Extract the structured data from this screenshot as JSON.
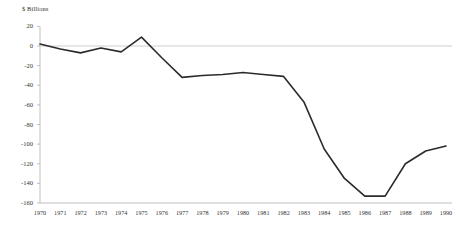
{
  "chart_data": {
    "type": "line",
    "title": "",
    "subtitle": "",
    "ylabel": "$ Billions",
    "xlabel": "",
    "ylim": [
      -160,
      20
    ],
    "xlim": [
      1970,
      1990
    ],
    "yticks": [
      20,
      0,
      -20,
      -40,
      -60,
      -80,
      -100,
      -120,
      -140,
      -160
    ],
    "ytick_labels": [
      "20",
      "0",
      "-20",
      "-40",
      "-60",
      "-80",
      "-100",
      "-120",
      "-140",
      "-160"
    ],
    "grid": false,
    "zero_line": true,
    "legend": null,
    "legend_position": "none",
    "line_color": "#2b2b2b",
    "axis_color": "#b0b0b0",
    "zero_line_color": "#c8c8c8",
    "categories": [
      "1970",
      "1971",
      "1972",
      "1973",
      "1974",
      "1975",
      "1976",
      "1977",
      "1978",
      "1979",
      "1980",
      "1981",
      "1982",
      "1983",
      "1984",
      "1985",
      "1986",
      "1987",
      "1988",
      "1989",
      "1990"
    ],
    "x": [
      1970,
      1971,
      1972,
      1973,
      1974,
      1975,
      1976,
      1977,
      1978,
      1979,
      1980,
      1981,
      1982,
      1983,
      1984,
      1985,
      1986,
      1987,
      1988,
      1989,
      1990
    ],
    "values": [
      2,
      -3,
      -7,
      -2,
      -6,
      9,
      -12,
      -32,
      -30,
      -29,
      -27,
      -29,
      -31,
      -57,
      -105,
      -135,
      -153,
      -153,
      -120,
      -107,
      -102
    ],
    "series": [
      {
        "name": "Budget balance",
        "values": [
          2,
          -3,
          -7,
          -2,
          -6,
          9,
          -12,
          -32,
          -30,
          -29,
          -27,
          -29,
          -31,
          -57,
          -105,
          -135,
          -153,
          -153,
          -120,
          -107,
          -102
        ]
      }
    ]
  }
}
